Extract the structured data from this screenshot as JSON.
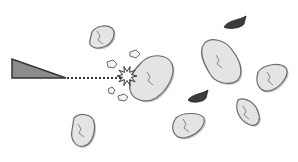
{
  "scene": {
    "width": 298,
    "height": 162,
    "background": "#ffffff"
  },
  "colors": {
    "rock_fill": "#e4e4e4",
    "rock_shade": "#c8c8c8",
    "rock_stroke": "#6a6a6a",
    "crack": "#7a7a7a",
    "ship_fill": "#8c8c8c",
    "ship_stroke": "#333333",
    "laser": "#333333",
    "enemy": "#3c3c3c"
  },
  "ship": {
    "name": "player-ship",
    "points": "12,59 12,78 66,78"
  },
  "laser": {
    "x1": 67,
    "y1": 78,
    "x2": 122,
    "y2": 78
  },
  "explosion": {
    "cx": 127,
    "cy": 76
  },
  "asteroids": [
    {
      "name": "asteroid-large-hit",
      "path": "M140,64 C150,52 168,54 172,64 C176,74 168,90 156,98 C146,104 132,100 130,90 C128,80 132,72 140,64 Z"
    },
    {
      "name": "asteroid-top-left",
      "path": "M92,32 C96,26 106,24 112,28 C116,32 114,42 106,46 C98,50 88,48 90,40 Z"
    },
    {
      "name": "asteroid-bottom-left",
      "path": "M74,118 C80,112 92,114 94,122 C96,132 92,144 84,146 C76,148 70,140 72,130 Z"
    },
    {
      "name": "asteroid-center-big",
      "path": "M204,44 C210,36 226,40 232,50 C240,60 244,72 238,80 C230,86 216,84 210,74 C204,64 198,52 204,44 Z"
    },
    {
      "name": "asteroid-right",
      "path": "M258,72 C264,64 280,62 286,68 C290,74 282,86 272,90 C262,94 254,86 258,72 Z"
    },
    {
      "name": "asteroid-bottom-center",
      "path": "M176,118 C182,112 200,112 204,118 C206,126 196,136 184,138 C172,138 170,126 176,118 Z"
    },
    {
      "name": "asteroid-bottom-right",
      "path": "M238,100 C246,96 256,104 258,112 C262,122 256,128 248,124 C240,120 234,110 238,100 Z"
    }
  ],
  "fragments": [
    {
      "name": "fragment-1",
      "path": "M130,52 l6,-2 l4,4 l-4,4 l-6,-2 Z"
    },
    {
      "name": "fragment-2",
      "path": "M107,62 l6,-2 l4,4 l-3,4 l-6,-1 Z"
    },
    {
      "name": "fragment-3",
      "path": "M108,89 l4,-2 l3,3 l-2,4 l-4,-1 Z"
    },
    {
      "name": "fragment-4",
      "path": "M118,96 l6,-2 l4,3 l-3,4 l-6,-1 Z"
    }
  ],
  "enemies": [
    {
      "name": "enemy-ship-top",
      "path": "M224,27 C228,20 240,20 246,16 L244,24 C242,28 228,30 224,27 Z"
    },
    {
      "name": "enemy-ship-middle",
      "path": "M188,100 C192,94 202,94 208,90 L206,98 C204,102 192,104 188,100 Z"
    }
  ]
}
